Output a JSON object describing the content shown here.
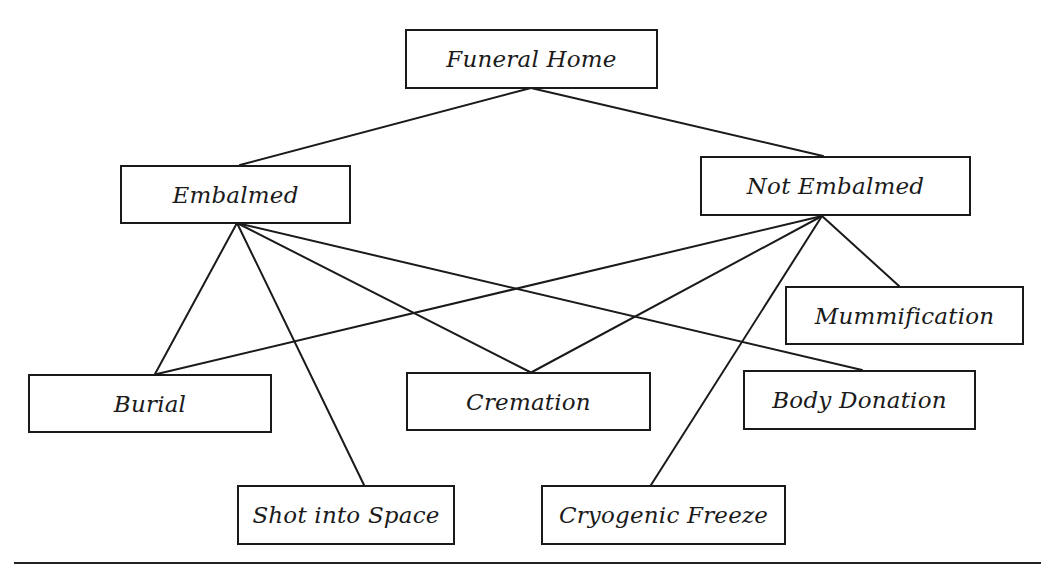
{
  "diagram": {
    "type": "hierarchy",
    "nodes": {
      "funeral_home": {
        "label": "Funeral Home",
        "x": 405,
        "y": 29,
        "w": 253,
        "h": 60
      },
      "embalmed": {
        "label": "Embalmed",
        "x": 120,
        "y": 165,
        "w": 231,
        "h": 59
      },
      "not_embalmed": {
        "label": "Not Embalmed",
        "x": 700,
        "y": 156,
        "w": 271,
        "h": 60
      },
      "mummification": {
        "label": "Mummification",
        "x": 785,
        "y": 286,
        "w": 239,
        "h": 59
      },
      "burial": {
        "label": "Burial",
        "x": 28,
        "y": 374,
        "w": 244,
        "h": 59
      },
      "cremation": {
        "label": "Cremation",
        "x": 406,
        "y": 372,
        "w": 245,
        "h": 59
      },
      "body_donation": {
        "label": "Body Donation",
        "x": 743,
        "y": 370,
        "w": 233,
        "h": 60
      },
      "shot_into_space": {
        "label": "Shot into Space",
        "x": 237,
        "y": 485,
        "w": 218,
        "h": 60
      },
      "cryogenic_freeze": {
        "label": "Cryogenic Freeze",
        "x": 541,
        "y": 485,
        "w": 245,
        "h": 60
      }
    },
    "edges": [
      {
        "from": "funeral_home",
        "to": "embalmed",
        "x1": 531,
        "y1": 88,
        "x2": 240,
        "y2": 165
      },
      {
        "from": "funeral_home",
        "to": "not_embalmed",
        "x1": 531,
        "y1": 88,
        "x2": 823,
        "y2": 156
      },
      {
        "from": "embalmed",
        "to": "burial",
        "x1": 237,
        "y1": 223,
        "x2": 155,
        "y2": 374
      },
      {
        "from": "embalmed",
        "to": "shot_into_space",
        "x1": 237,
        "y1": 223,
        "x2": 364,
        "y2": 485
      },
      {
        "from": "embalmed",
        "to": "cremation",
        "x1": 237,
        "y1": 223,
        "x2": 530,
        "y2": 372
      },
      {
        "from": "embalmed",
        "to": "body_donation",
        "x1": 237,
        "y1": 223,
        "x2": 862,
        "y2": 370
      },
      {
        "from": "not_embalmed",
        "to": "burial",
        "x1": 822,
        "y1": 216,
        "x2": 157,
        "y2": 374
      },
      {
        "from": "not_embalmed",
        "to": "cremation",
        "x1": 822,
        "y1": 216,
        "x2": 532,
        "y2": 372
      },
      {
        "from": "not_embalmed",
        "to": "cryogenic_freeze",
        "x1": 822,
        "y1": 216,
        "x2": 651,
        "y2": 485
      },
      {
        "from": "not_embalmed",
        "to": "mummification",
        "x1": 822,
        "y1": 216,
        "x2": 899,
        "y2": 286
      }
    ],
    "bottom_rule": {
      "x": 14,
      "y": 562,
      "w": 1027
    },
    "colors": {
      "stroke": "#1a1a1a",
      "background": "#ffffff",
      "text": "#1a1a1a"
    }
  }
}
